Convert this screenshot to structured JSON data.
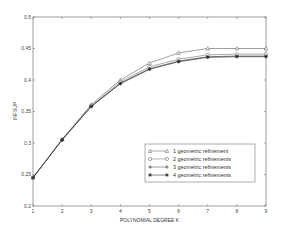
{
  "chart_data": {
    "type": "line",
    "title": "",
    "xlabel": "POLYNOMIAL DEGREE K",
    "ylabel": "INFSUP",
    "xlim": [
      1,
      9
    ],
    "ylim": [
      0.2,
      0.5
    ],
    "x": [
      1,
      2,
      3,
      4,
      5,
      6,
      7,
      8,
      9
    ],
    "xticks": [
      "1",
      "2",
      "3",
      "4",
      "5",
      "6",
      "7",
      "8",
      "9"
    ],
    "yticks": [
      "0.2",
      "0.25",
      "0.3",
      "0.35",
      "0.4",
      "0.45",
      "0.5"
    ],
    "grid": false,
    "legend_position": "lower right",
    "series": [
      {
        "name": "1 geometric refinement",
        "marker": "triangle",
        "values": [
          0.245,
          0.306,
          0.361,
          0.4,
          0.427,
          0.443,
          0.45,
          0.45,
          0.45
        ]
      },
      {
        "name": "2 geometric refinements",
        "marker": "circle",
        "values": [
          0.245,
          0.305,
          0.359,
          0.397,
          0.421,
          0.433,
          0.44,
          0.441,
          0.441
        ]
      },
      {
        "name": "3 geometric refinements",
        "marker": "plus",
        "values": [
          0.245,
          0.305,
          0.358,
          0.395,
          0.418,
          0.43,
          0.437,
          0.438,
          0.438
        ]
      },
      {
        "name": "4 geometric refinements",
        "marker": "star",
        "values": [
          0.245,
          0.305,
          0.358,
          0.394,
          0.417,
          0.429,
          0.436,
          0.437,
          0.437
        ]
      }
    ]
  }
}
